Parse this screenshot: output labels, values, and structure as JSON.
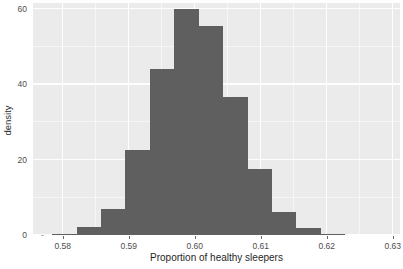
{
  "chart_data": {
    "type": "bar",
    "title": "",
    "subtitle": "",
    "xlabel": "Proportion of healthy sleepers",
    "ylabel": "density",
    "xlim": [
      0.5755,
      0.6311
    ],
    "ylim": [
      0,
      61.5
    ],
    "grid": true,
    "legend": null,
    "legend_position": "none",
    "bar_color": "#5f5f5f",
    "panel_background": "#ebebeb",
    "gridline_color": "#ffffff",
    "xtick_labels": [
      "0.58",
      "0.59",
      "0.60",
      "0.61",
      "0.62",
      "0.63"
    ],
    "xtick_values": [
      0.58,
      0.59,
      0.6,
      0.61,
      0.62,
      0.63
    ],
    "ytick_labels": [
      "0",
      "20",
      "40",
      "60"
    ],
    "ytick_values": [
      0,
      20,
      40,
      60
    ],
    "x_minor_gridlines": [
      0.585,
      0.595,
      0.605,
      0.615,
      0.625
    ],
    "y_minor_gridlines": [
      10,
      30,
      50
    ],
    "bin_width": 0.0037,
    "bin_edges": [
      0.5784,
      0.5821,
      0.5858,
      0.5895,
      0.5932,
      0.5969,
      0.6006,
      0.6043,
      0.608,
      0.6117,
      0.6154,
      0.6191,
      0.6228
    ],
    "bin_centers": [
      0.58025,
      0.58395,
      0.58765,
      0.59135,
      0.59505,
      0.59875,
      0.60245,
      0.60615,
      0.60985,
      0.61355,
      0.61725,
      0.62095
    ],
    "values": [
      0.3,
      2.0,
      7.0,
      22.5,
      44.0,
      60.0,
      55.5,
      36.5,
      17.5,
      6.0,
      1.8,
      0.3
    ],
    "categories": [
      "0.5784-0.5821",
      "0.5821-0.5858",
      "0.5858-0.5895",
      "0.5895-0.5932",
      "0.5932-0.5969",
      "0.5969-0.6006",
      "0.6006-0.6043",
      "0.6043-0.6080",
      "0.6080-0.6117",
      "0.6117-0.6154",
      "0.6154-0.6191",
      "0.6191-0.6228"
    ]
  }
}
